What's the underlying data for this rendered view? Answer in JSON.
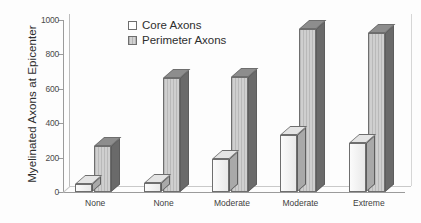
{
  "chart_data": {
    "type": "bar",
    "title": "",
    "xlabel": "",
    "ylabel": "Myelinated Axons at Epicenter",
    "categories": [
      "None",
      "None",
      "Moderate",
      "Moderate",
      "Extreme"
    ],
    "series": [
      {
        "name": "Core Axons",
        "values": [
          45,
          50,
          190,
          330,
          285
        ]
      },
      {
        "name": "Perimeter Axons",
        "values": [
          270,
          665,
          670,
          945,
          925
        ]
      }
    ],
    "ylim": [
      0,
      1000
    ],
    "yticks": [
      0,
      200,
      400,
      600,
      800,
      1000
    ],
    "ytick_labels": [
      "0",
      "200",
      "400",
      "600",
      "800",
      "1000"
    ],
    "grid": false,
    "legend_position": "top-left-inside",
    "style": "3d-extruded-grayscale"
  },
  "legend": {
    "items": [
      {
        "label": "Core Axons",
        "swatch": "white-square-icon"
      },
      {
        "label": "Perimeter Axons",
        "swatch": "gray-square-icon"
      }
    ]
  },
  "axes": {
    "y_title": "Myelinated Axons at Epicenter"
  }
}
